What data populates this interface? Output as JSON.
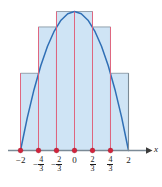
{
  "figure": {
    "name": "riemann-sum-rectangles-figure",
    "width": 162,
    "height": 187
  },
  "axis": {
    "x_label": "x",
    "arrow": "right-arrow",
    "line_color": "#7b8a96"
  },
  "colors": {
    "curve": "#2f6fb5",
    "fill": "#cfe4f5",
    "rect_edge": "#8a98a6",
    "partition_line": "#e8607a",
    "dot": "#d2233c",
    "axis": "#7b8a96",
    "text": "#1a1a1a"
  },
  "ticks": [
    {
      "value": -2,
      "sign": "-",
      "whole": "2",
      "num": null,
      "den": null,
      "dot": true
    },
    {
      "value": -1.3333,
      "sign": "-",
      "whole": null,
      "num": "4",
      "den": "3",
      "dot": true
    },
    {
      "value": -0.6667,
      "sign": "-",
      "whole": null,
      "num": "2",
      "den": "3",
      "dot": true
    },
    {
      "value": 0,
      "sign": "",
      "whole": "0",
      "num": null,
      "den": null,
      "dot": true
    },
    {
      "value": 0.6667,
      "sign": "",
      "whole": null,
      "num": "2",
      "den": "3",
      "dot": true
    },
    {
      "value": 1.3333,
      "sign": "",
      "whole": null,
      "num": "4",
      "den": "3",
      "dot": true
    },
    {
      "value": 2,
      "sign": "",
      "whole": "2",
      "num": null,
      "den": null,
      "dot": false
    }
  ],
  "chart_data": {
    "type": "area",
    "title": "",
    "xlabel": "x",
    "ylabel": "",
    "xlim": [
      -2.35,
      2.45
    ],
    "ylim": [
      0,
      4.55
    ],
    "grid": false,
    "legend": null,
    "curve": {
      "name": "f(x) = 4 - x^2",
      "description": "downward parabola from (-2,0) to (2,0) with vertex (0,4)",
      "points_x": [
        -2,
        -1.75,
        -1.5,
        -1.25,
        -1,
        -0.75,
        -0.5,
        -0.25,
        0,
        0.25,
        0.5,
        0.75,
        1,
        1.25,
        1.5,
        1.75,
        2
      ],
      "points_y": [
        0,
        0.9375,
        1.75,
        2.4375,
        3,
        3.4375,
        3.75,
        3.9375,
        4,
        3.9375,
        3.75,
        3.4375,
        3,
        2.4375,
        1.75,
        0.9375,
        0
      ]
    },
    "partition": {
      "n": 6,
      "a": -2,
      "b": 2,
      "width": 0.6667,
      "edges": [
        -2,
        -1.3333,
        -0.6667,
        0,
        0.6667,
        1.3333,
        2
      ]
    },
    "rectangles": [
      {
        "x_left": -2,
        "x_right": -1.3333,
        "height": 2.2222,
        "sample": "right-endpoint",
        "sample_x": -1.3333
      },
      {
        "x_left": -1.3333,
        "x_right": -0.6667,
        "height": 3.5556,
        "sample": "right-endpoint",
        "sample_x": -0.6667
      },
      {
        "x_left": -0.6667,
        "x_right": 0,
        "height": 4.0,
        "sample": "right-endpoint",
        "sample_x": 0
      },
      {
        "x_left": 0,
        "x_right": 0.6667,
        "height": 4.0,
        "sample": "left-endpoint",
        "sample_x": 0
      },
      {
        "x_left": 0.6667,
        "x_right": 1.3333,
        "height": 3.5556,
        "sample": "left-endpoint",
        "sample_x": 0.6667
      },
      {
        "x_left": 1.3333,
        "x_right": 2,
        "height": 2.2222,
        "sample": "left-endpoint",
        "sample_x": 1.3333
      }
    ]
  }
}
